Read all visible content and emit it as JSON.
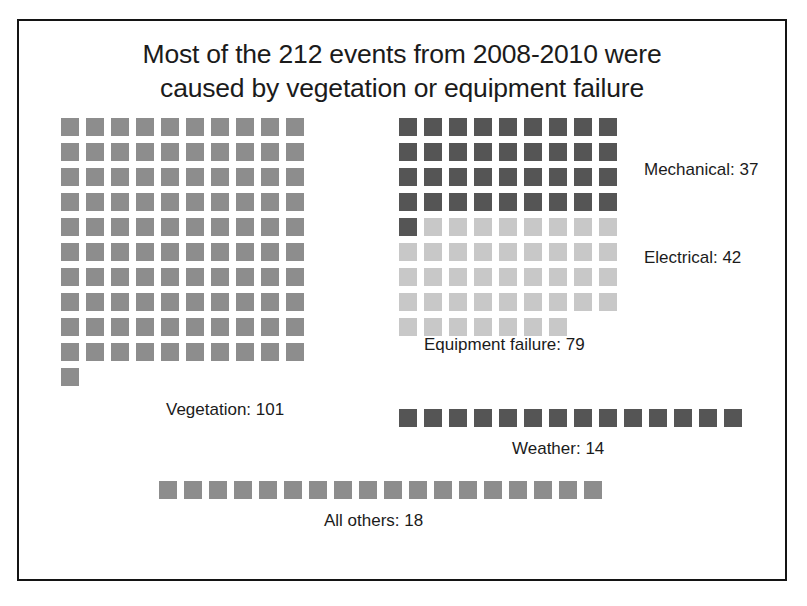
{
  "chart_data": {
    "type": "waffle",
    "title": "Most of the 212 events from 2008-2010 were\ncaused by vegetation or equipment failure",
    "total": 212,
    "unit_value": 1,
    "categories": [
      "Vegetation",
      "Equipment failure",
      "Weather",
      "All others"
    ],
    "values": [
      101,
      79,
      14,
      18
    ],
    "series": [
      {
        "name": "Vegetation",
        "label": "Vegetation: 101",
        "value": 101,
        "color": "#8d8d8d",
        "columns": 10,
        "square_px": 18,
        "gap_px": 7
      },
      {
        "name": "Equipment failure",
        "label": "Equipment failure: 79",
        "value": 79,
        "columns": 9,
        "square_px": 18,
        "gap_px": 7,
        "subseries": [
          {
            "name": "Mechanical",
            "label": "Mechanical: 37",
            "value": 37,
            "color": "#555555"
          },
          {
            "name": "Electrical",
            "label": "Electrical: 42",
            "value": 42,
            "color": "#c8c8c8"
          }
        ]
      },
      {
        "name": "Weather",
        "label": "Weather: 14",
        "value": 14,
        "color": "#555555",
        "columns": 14,
        "square_px": 18,
        "gap_px": 7
      },
      {
        "name": "All others",
        "label": "All others: 18",
        "value": 18,
        "color": "#8d8d8d",
        "columns": 18,
        "square_px": 18,
        "gap_px": 7
      }
    ],
    "legend": "inline-labels",
    "grid": false,
    "xlabel": "",
    "ylabel": "",
    "colors": {
      "vegetation": "#8d8d8d",
      "mechanical": "#555555",
      "electrical": "#c8c8c8",
      "weather": "#555555",
      "all_others": "#8d8d8d",
      "frame": "#141414",
      "text": "#1b1b1b",
      "background": "#ffffff"
    }
  }
}
